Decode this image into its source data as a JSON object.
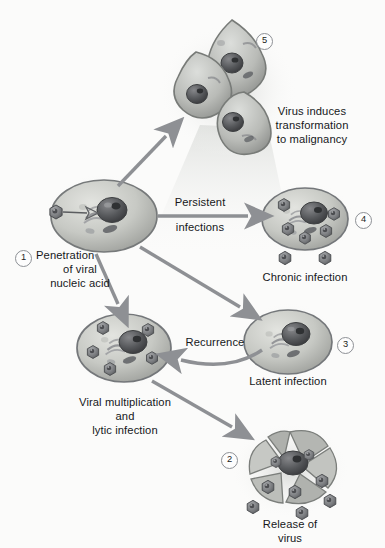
{
  "figure": {
    "style": "grayscale textbook illustration",
    "background_color": "#fbfbfa",
    "arrow_color": "#8e9094",
    "cell_fill": "#c9cbc6",
    "cell_outline": "#7a7d7a",
    "nucleus_color": "#4e4f50",
    "virion_color": "#6f7174",
    "text_color": "#16181a"
  },
  "steps": [
    {
      "number": "1",
      "label": "Penetration\nof viral\nnucleic acid",
      "label_lines": [
        "Penetration",
        "of viral",
        "nucleic acid"
      ],
      "node": "host-cell"
    },
    {
      "number": "2",
      "label": "Release of\nvirus",
      "label_lines": [
        "Release of",
        "virus"
      ],
      "node": "lysed-cell"
    },
    {
      "number": "3",
      "label": "Latent infection",
      "label_lines": [
        "Latent infection"
      ],
      "node": "latent-cell"
    },
    {
      "number": "4",
      "label": "Chronic infection",
      "label_lines": [
        "Chronic infection"
      ],
      "node": "chronic-cell"
    },
    {
      "number": "5",
      "label": "Virus induces\ntransformation\nto malignancy",
      "label_lines": [
        "Virus induces",
        "transformation",
        "to malignancy"
      ],
      "node": "transformed-cells"
    }
  ],
  "nodes": {
    "host_cell": {
      "name": "Host cell penetrated by virus",
      "virions_inside": 0,
      "virion_attached": 1
    },
    "transformed_cells": {
      "name": "Malignant transformed cells",
      "cell_count": 3
    },
    "chronic_cell": {
      "name": "Chronically infected cell",
      "virions_inside": 5,
      "virions_released": 2
    },
    "latent_cell": {
      "name": "Latently infected cell",
      "virions_inside": 0
    },
    "multiplying_cell": {
      "name": "Cell with viral multiplication",
      "virions_inside": 5
    },
    "lysed_cell": {
      "name": "Lysed cell releasing virus",
      "virions_released": 6
    }
  },
  "pathway_labels": {
    "persistent_line1": "Persistent",
    "persistent_line2": "infections",
    "recurrence": "Recurrence",
    "multiplication_line1": "Viral multiplication",
    "multiplication_line2": "and",
    "multiplication_line3": "lytic infection"
  },
  "arrows": [
    {
      "name": "host-to-transformed",
      "from": "host-cell",
      "to": "transformed-cells",
      "label": ""
    },
    {
      "name": "host-to-chronic",
      "from": "host-cell",
      "to": "chronic-cell",
      "label": "Persistent infections"
    },
    {
      "name": "host-to-latent",
      "from": "host-cell",
      "to": "latent-cell",
      "label": ""
    },
    {
      "name": "host-to-multiplication",
      "from": "host-cell",
      "to": "multiplying-cell",
      "label": ""
    },
    {
      "name": "latent-to-multiplication",
      "from": "latent-cell",
      "to": "multiplying-cell",
      "label": "Recurrence"
    },
    {
      "name": "multiplication-to-lysis",
      "from": "multiplying-cell",
      "to": "lysed-cell",
      "label": ""
    }
  ]
}
